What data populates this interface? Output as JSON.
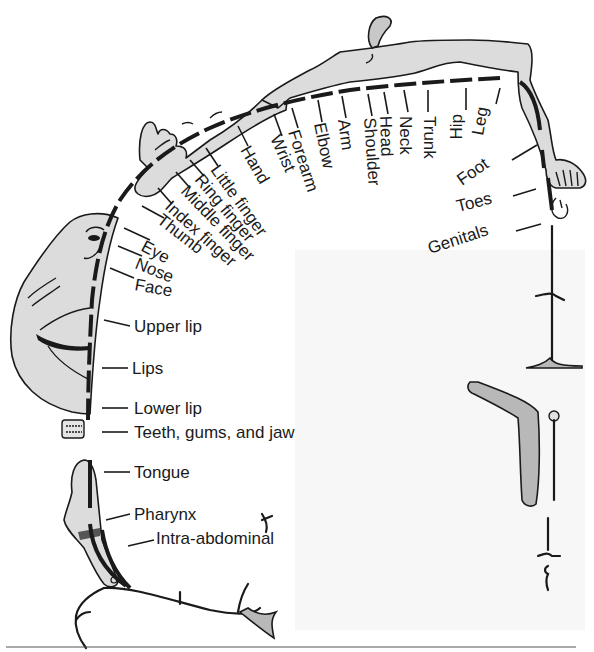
{
  "figure": {
    "type": "sensory homunculus",
    "labels": {
      "genitals": "Genitals",
      "toes": "Toes",
      "foot": "Foot",
      "leg": "Leg",
      "hip": "Hip",
      "trunk": "Trunk",
      "neck": "Neck",
      "head": "Head",
      "shoulder": "Shoulder",
      "arm": "Arm",
      "elbow": "Elbow",
      "forearm": "Forearm",
      "wrist": "Wrist",
      "hand": "Hand",
      "little_finger": "Little finger",
      "ring_finger": "Ring finger",
      "middle_finger": "Middle finger",
      "index_finger": "Index finger",
      "thumb": "Thumb",
      "eye": "Eye",
      "nose": "Nose",
      "face": "Face",
      "upper_lip": "Upper lip",
      "lips": "Lips",
      "lower_lip": "Lower lip",
      "teeth": "Teeth, gums, and jaw",
      "tongue": "Tongue",
      "pharynx": "Pharynx",
      "intra_abdominal": "Intra-abdominal"
    },
    "colors": {
      "ink": "#1a1a1a",
      "body_fill": "#dcdcdc",
      "shade": "#b8b8b8",
      "background": "#ffffff"
    }
  }
}
